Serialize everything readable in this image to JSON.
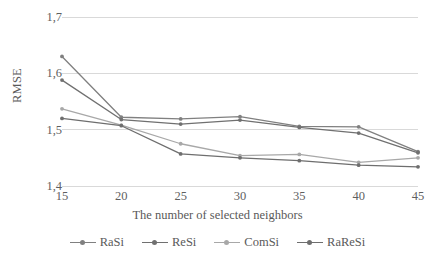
{
  "chart_data": {
    "type": "line",
    "title": "",
    "xlabel": "The number of selected neighbors",
    "ylabel": "RMSE",
    "x": [
      15,
      20,
      25,
      30,
      35,
      40,
      45
    ],
    "xtick_labels": [
      "15",
      "20",
      "25",
      "30",
      "35",
      "40",
      "45"
    ],
    "ytick_labels": [
      "1,4",
      "1,5",
      "1,6",
      "1,7"
    ],
    "ytick_values": [
      1.4,
      1.5,
      1.6,
      1.7
    ],
    "ylim": [
      1.4,
      1.7
    ],
    "grid": "horizontal",
    "legend_position": "bottom",
    "series": [
      {
        "name": "RaSi",
        "color": "#808080",
        "values": [
          1.63,
          1.522,
          1.519,
          1.523,
          1.506,
          1.505,
          1.461
        ]
      },
      {
        "name": "ReSi",
        "color": "#707070",
        "values": [
          1.588,
          1.518,
          1.51,
          1.517,
          1.504,
          1.494,
          1.459
        ]
      },
      {
        "name": "ComSi",
        "color": "#a8a8a8",
        "values": [
          1.537,
          1.508,
          1.475,
          1.454,
          1.456,
          1.442,
          1.45
        ]
      },
      {
        "name": "RaReSi",
        "color": "#6e6e6e",
        "values": [
          1.52,
          1.507,
          1.457,
          1.45,
          1.445,
          1.437,
          1.434
        ]
      }
    ]
  },
  "style": {
    "gridline_color": "#d9d9d9",
    "text_color": "#5a5a5a",
    "background": "#ffffff"
  }
}
